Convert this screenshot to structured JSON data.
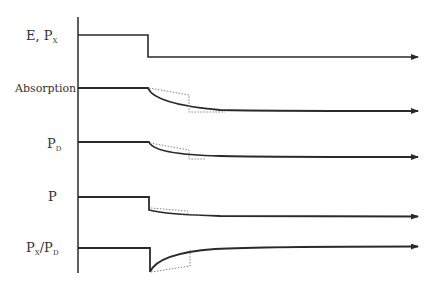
{
  "diagram": {
    "type": "timing-response-diagram",
    "axis": {
      "x": 78,
      "y_top": 17,
      "y_bottom": 273
    },
    "step_x": 149,
    "arrow_end_x": 418,
    "traces": [
      {
        "id": "e-px",
        "label_main": "E,  P",
        "label_sub": "X",
        "label_x": 26,
        "label_y": 40,
        "baseline_y": 35,
        "final_y": 57,
        "shape": "step-down"
      },
      {
        "id": "absorption",
        "label_main": "Absorption",
        "label_sub": "",
        "label_x": 15,
        "label_y": 92,
        "baseline_y": 88,
        "final_y": 110,
        "shape": "exp-decay",
        "dotted": {
          "x2": 189,
          "y_mid": 95,
          "y_end": 111
        }
      },
      {
        "id": "pd",
        "label_main": "P",
        "label_sub": "D",
        "label_x": 47,
        "label_y": 148,
        "baseline_y": 142,
        "final_y": 157,
        "shape": "exp-decay",
        "dotted": {
          "x2": 189,
          "y_mid": 150,
          "y_end": 158
        }
      },
      {
        "id": "p",
        "label_main": "P",
        "label_sub": "",
        "label_x": 48,
        "label_y": 201,
        "baseline_y": 197,
        "final_y": 216,
        "shape": "step-then-decay",
        "step_to": 210,
        "dotted": {
          "x2": 189,
          "y_mid": 208,
          "y_end": 214
        }
      },
      {
        "id": "px-pd",
        "label_main": "P",
        "label_sub": "X",
        "label_main2": "/P",
        "label_sub2": "D",
        "label_x": 26,
        "label_y": 252,
        "baseline_y": 248,
        "final_y": 246,
        "shape": "step-down-then-recover",
        "step_to": 272,
        "dotted": {
          "x2": 190,
          "y_mid": 266,
          "y_end": 249
        }
      }
    ]
  }
}
